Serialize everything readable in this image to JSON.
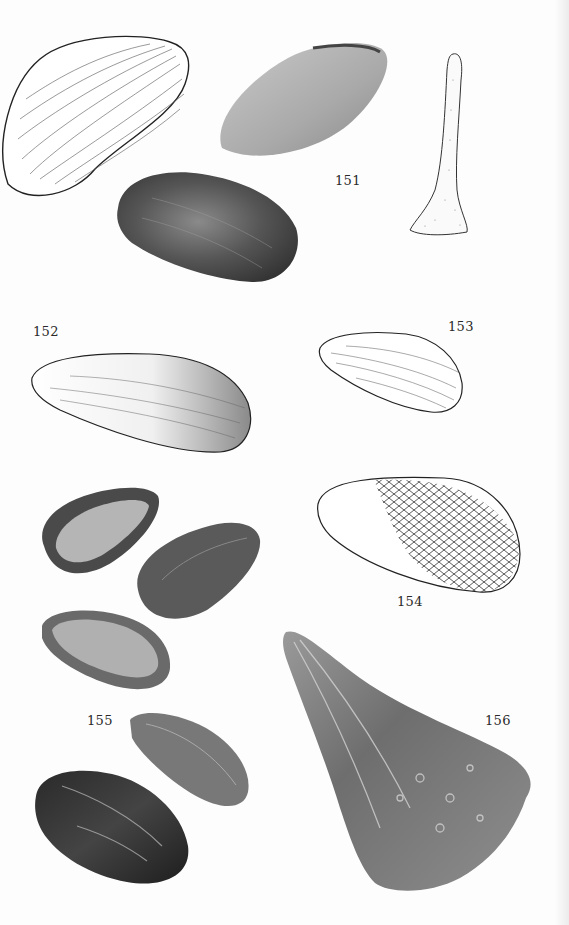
{
  "plate": {
    "figures": [
      {
        "id": "151",
        "label": "151",
        "items": [
          "line drawing of mussel shell (upper left)",
          "photo of pale shell (upper center)",
          "photo of dark shell (center)",
          "stippled drawing of elongated triangular shell (right)"
        ]
      },
      {
        "id": "152",
        "label": "152",
        "items": [
          "stippled drawing of elongated shell"
        ]
      },
      {
        "id": "153",
        "label": "153",
        "items": [
          "line drawing of small shell"
        ]
      },
      {
        "id": "154",
        "label": "154",
        "items": [
          "drawing of shell with scaly pattern"
        ]
      },
      {
        "id": "155",
        "label": "155",
        "items": [
          "photo of five dark elongated shells"
        ]
      },
      {
        "id": "156",
        "label": "156",
        "items": [
          "photo of wedge-shaped pen shell"
        ]
      }
    ]
  },
  "colors": {
    "paper": "#fdfdfd",
    "ink": "#2a2a2a",
    "photo_dark": "#3a3a3a",
    "photo_mid": "#7a7a7a",
    "photo_light": "#b8b8b8"
  }
}
